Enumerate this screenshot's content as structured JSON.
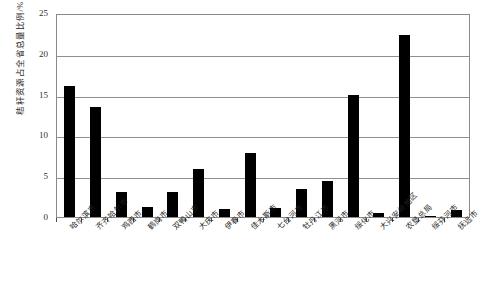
{
  "chart_data": {
    "type": "bar",
    "title": "",
    "xlabel": "",
    "ylabel": "秸秆资源占全省总量比例/%",
    "ylim": [
      0,
      25
    ],
    "yticks": [
      0,
      5,
      10,
      15,
      20,
      25
    ],
    "grid": true,
    "legend": "none",
    "bar_color": "#000000",
    "categories": [
      "哈尔滨市",
      "齐齐哈尔市",
      "鸡西市",
      "鹤岗市",
      "双鸭山市",
      "大庆市",
      "伊春市",
      "佳木斯市",
      "七台河市",
      "牡丹江市",
      "黑河市",
      "绥化市",
      "大兴安岭地区",
      "农垦总局",
      "绥芬河市",
      "抚远市"
    ],
    "values": [
      16.1,
      13.5,
      3.1,
      1.2,
      3.1,
      5.9,
      1.0,
      7.8,
      1.1,
      3.4,
      4.4,
      15.0,
      0.5,
      22.3,
      0.15,
      0.9
    ]
  }
}
